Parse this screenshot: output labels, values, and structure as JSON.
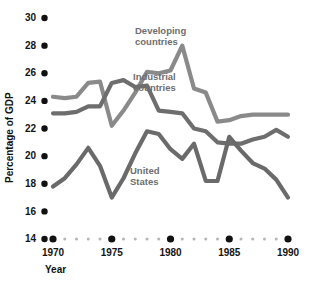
{
  "chart_data": {
    "type": "line",
    "title": "",
    "xlabel": "Year",
    "ylabel": "Percentage of GDP",
    "xlim": [
      1969.3,
      1990.6
    ],
    "ylim": [
      14,
      30
    ],
    "grid": false,
    "legend_position": "inline-annotations",
    "x": [
      1970,
      1971,
      1972,
      1973,
      1974,
      1975,
      1976,
      1977,
      1978,
      1979,
      1980,
      1981,
      1982,
      1983,
      1984,
      1985,
      1986,
      1987,
      1988,
      1989,
      1990
    ],
    "x_major_ticks": [
      1970,
      1975,
      1980,
      1985,
      1990
    ],
    "x_tick_labels": [
      "1970",
      "1975",
      "1980",
      "1985",
      "1990"
    ],
    "y_ticks": [
      14,
      16,
      18,
      20,
      22,
      24,
      26,
      28,
      30
    ],
    "y_tick_labels": [
      "14",
      "16",
      "18",
      "20",
      "22",
      "24",
      "26",
      "28",
      "30"
    ],
    "series": [
      {
        "name": "Developing countries",
        "color": "#8a8a8a",
        "label_line1": "Developing",
        "label_line2": "countries",
        "values": [
          24.3,
          24.2,
          24.3,
          25.3,
          25.4,
          22.2,
          23.3,
          24.6,
          26.1,
          26.0,
          26.2,
          28.0,
          24.9,
          24.6,
          22.5,
          22.6,
          22.9,
          23.0,
          23.0,
          23.0,
          23.0
        ]
      },
      {
        "name": "Industrial countries",
        "color": "#6e6e6e",
        "label_line1": "Industrial",
        "label_line2": "countries",
        "values": [
          23.1,
          23.1,
          23.2,
          23.6,
          23.6,
          25.3,
          25.5,
          25.0,
          25.1,
          23.3,
          23.2,
          23.1,
          22.0,
          21.8,
          21.0,
          20.9,
          20.9,
          21.2,
          21.4,
          21.9,
          21.4
        ]
      },
      {
        "name": "United States",
        "color": "#6a6a6a",
        "label_line1": "United",
        "label_line2": "States",
        "values": [
          17.8,
          18.4,
          19.4,
          20.6,
          19.3,
          17.0,
          18.4,
          20.2,
          21.8,
          21.6,
          20.5,
          19.8,
          20.9,
          18.2,
          18.2,
          21.4,
          20.4,
          19.5,
          19.1,
          18.3,
          17.0
        ]
      }
    ]
  },
  "axis": {
    "y_title": "Percentage of GDP",
    "x_title": "Year"
  },
  "markers": {
    "major_dot_color": "#111111",
    "minor_dot_color": "#b5b5b5"
  }
}
